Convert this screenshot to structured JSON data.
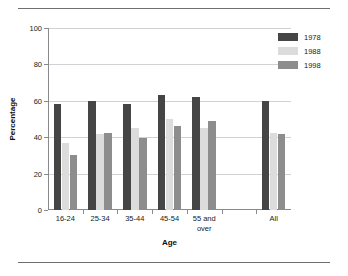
{
  "chart_data": {
    "type": "bar",
    "title": "",
    "xlabel": "Age",
    "ylabel": "Percentage",
    "ylim": [
      0,
      100
    ],
    "yticks": [
      0,
      20,
      40,
      60,
      80,
      100
    ],
    "grid": true,
    "legend_position": "top-right",
    "categories": [
      "16-24",
      "25-34",
      "35-44",
      "45-54",
      "55 and over",
      "All"
    ],
    "series": [
      {
        "name": "1978",
        "color": "#454545",
        "values": [
          58,
          60,
          58,
          63,
          62,
          60
        ]
      },
      {
        "name": "1988",
        "color": "#dcdcdc",
        "values": [
          37,
          42,
          45,
          50,
          45,
          42.5
        ]
      },
      {
        "name": "1998",
        "color": "#8d8d8d",
        "values": [
          30,
          42.5,
          39.5,
          46,
          49,
          42
        ]
      }
    ]
  },
  "axis": {
    "y_title": "Percentage",
    "x_title": "Age",
    "y_tick_labels": [
      "0",
      "20",
      "40",
      "60",
      "80",
      "100"
    ],
    "x_tick_labels": [
      "16-24",
      "25-34",
      "35-44",
      "45-54",
      "55 and\nover",
      "All"
    ]
  },
  "legend": {
    "items": [
      {
        "label": "1978",
        "color": "#454545"
      },
      {
        "label": "1988",
        "color": "#dcdcdc"
      },
      {
        "label": "1998",
        "color": "#8d8d8d"
      }
    ]
  },
  "style": {
    "rule_color": "#6e6e73",
    "grid_color": "#d2d2d4",
    "axis_color": "#8a8a8e",
    "background": "#ffffff"
  }
}
